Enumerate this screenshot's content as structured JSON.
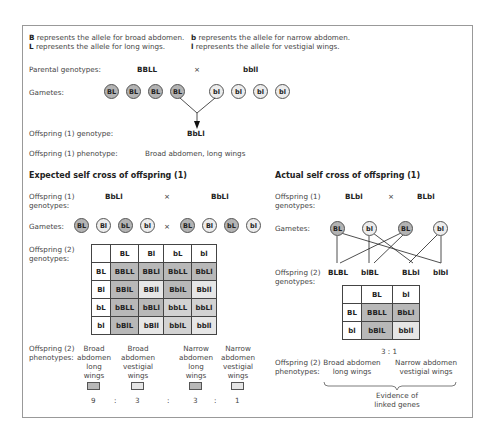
{
  "key": {
    "B_sym": "B",
    "B_text": " represents the allele for broad abdomen.",
    "b_sym": "b",
    "b_text": " represents the allele for narrow abdomen.",
    "L_sym": "L",
    "L_text": " represents the allele for long wings.",
    "l_sym": "l",
    "l_text": " represents the allele for vestigial wings."
  },
  "parental": {
    "label": "Parental genotypes:",
    "left": "BBLL",
    "cross": "×",
    "right": "bbll",
    "gametes_label": "Gametes:",
    "gametes": [
      "BL",
      "BL",
      "BL",
      "BL",
      "bl",
      "bl",
      "bl",
      "bl"
    ],
    "offspring_genotype_label": "Offspring (1) genotype:",
    "offspring_genotype": "BbLl",
    "offspring_phenotype_label": "Offspring (1) phenotype:",
    "offspring_phenotype": "Broad abdomen, long wings"
  },
  "expected": {
    "title": "Expected self cross of offspring (1)",
    "genotypes_label_1": "Offspring (1)",
    "genotypes_label_2": "genotypes:",
    "left": "BbLl",
    "cross": "×",
    "right": "BbLl",
    "gametes_label": "Gametes:",
    "gametes_left": [
      "BL",
      "Bl",
      "bL",
      "bl"
    ],
    "gametes_right": [
      "BL",
      "Bl",
      "bL",
      "bl"
    ],
    "gametes_cross": "×",
    "off2_label_1": "Offspring (2)",
    "off2_label_2": "genotypes:",
    "punnett": {
      "cols": [
        "BL",
        "Bl",
        "bL",
        "bl"
      ],
      "rows": [
        {
          "head": "BL",
          "cells": [
            "BBLL",
            "BBLl",
            "BbLL",
            "BbLl"
          ]
        },
        {
          "head": "Bl",
          "cells": [
            "BBlL",
            "BBll",
            "BblL",
            "Bbll"
          ]
        },
        {
          "head": "bL",
          "cells": [
            "bBLL",
            "bBLl",
            "bbLL",
            "bbLl"
          ]
        },
        {
          "head": "bl",
          "cells": [
            "bBlL",
            "bBll",
            "bblL",
            "bbll"
          ]
        }
      ]
    },
    "phen_label_1": "Offspring (2)",
    "phen_label_2": "phenotypes:",
    "phenotypes": [
      {
        "l1": "Broad",
        "l2": "abdomen",
        "l3": "long",
        "l4": "wings",
        "ratio": "9"
      },
      {
        "l1": "Broad",
        "l2": "abdomen",
        "l3": "vestigial",
        "l4": "wings",
        "ratio": "3"
      },
      {
        "l1": "Narrow",
        "l2": "abdomen",
        "l3": "long",
        "l4": "wings",
        "ratio": "3"
      },
      {
        "l1": "Narrow",
        "l2": "abdomen",
        "l3": "vestigial",
        "l4": "wings",
        "ratio": "1"
      }
    ],
    "ratio_sep": ":"
  },
  "actual": {
    "title": "Actual self cross of offspring (1)",
    "genotypes_label_1": "Offspring (1)",
    "genotypes_label_2": "genotypes:",
    "left": "BLbl",
    "cross": "×",
    "right": "BLbl",
    "gametes_label": "Gametes:",
    "gametes": [
      "BL",
      "bl",
      "BL",
      "bl"
    ],
    "off2_label_1": "Offspring (2)",
    "off2_label_2": "genotypes:",
    "offspring": [
      "BLBL",
      "blBL",
      "BLbl",
      "blbl"
    ],
    "punnett": {
      "cols": [
        "BL",
        "bl"
      ],
      "rows": [
        {
          "head": "BL",
          "cells": [
            "BBLL",
            "BbLl"
          ]
        },
        {
          "head": "bl",
          "cells": [
            "bBlL",
            "bbll"
          ]
        }
      ]
    },
    "ratio": "3 : 1",
    "phen_label_1": "Offspring (2)",
    "phen_label_2": "phenotypes:",
    "phen_a_1": "Broad abdomen",
    "phen_a_2": "long wings",
    "phen_b_1": "Narrow abdomen",
    "phen_b_2": "vestigial wings",
    "evidence_1": "Evidence of",
    "evidence_2": "linked genes"
  }
}
